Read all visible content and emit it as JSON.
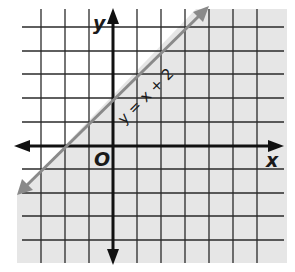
{
  "chart_data": {
    "type": "line",
    "title": "",
    "xlabel": "x",
    "ylabel": "y",
    "origin_label": "O",
    "grid": true,
    "xlim": [
      -4,
      6
    ],
    "ylim": [
      -5,
      5
    ],
    "series": [
      {
        "name": "y = x + 2",
        "equation": "y = x + 2",
        "slope": 1,
        "intercept": 2,
        "style": "solid",
        "x": [
          -4,
          4
        ],
        "y": [
          -2,
          6
        ]
      }
    ],
    "shaded_region": "below line (y < x + 2)",
    "annotations": [
      {
        "text": "y = x + 2",
        "position": "along line, near (1, 3)"
      }
    ]
  },
  "labels": {
    "x_axis": "x",
    "y_axis": "y",
    "origin": "O",
    "line": "y = x + 2"
  },
  "colors": {
    "grid": "#2a2a2a",
    "axis": "#111111",
    "boundary_line": "#8a8a8a",
    "shade": "#e6e6e6",
    "background": "#ffffff"
  }
}
